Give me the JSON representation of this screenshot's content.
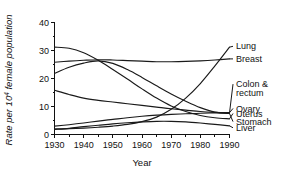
{
  "chart_data": {
    "type": "line",
    "title": "",
    "subtitle": "",
    "xlabel": "Year",
    "ylabel": "Rate per 10⁴ female population",
    "ylabel_prefix": "Rate per 10",
    "ylabel_exponent": "4",
    "ylabel_suffix": " female population",
    "xlim": [
      1930,
      1990
    ],
    "ylim": [
      0,
      40
    ],
    "xticks": [
      1930,
      1940,
      1950,
      1960,
      1970,
      1980,
      1990
    ],
    "xticklabels": [
      "1930",
      "1940",
      "1950",
      "1960",
      "1970",
      "1980",
      "1990"
    ],
    "yticks": [
      0,
      10,
      20,
      30,
      40
    ],
    "yticklabels": [
      "0",
      "10",
      "20",
      "30",
      "40"
    ],
    "yminorticks": [
      5,
      15,
      25,
      35
    ],
    "grid": false,
    "legend_position": "right-outside-labels",
    "line_color": "#1a1a1a",
    "x": [
      1930,
      1935,
      1940,
      1945,
      1950,
      1955,
      1960,
      1965,
      1970,
      1975,
      1980,
      1985,
      1990
    ],
    "series": [
      {
        "name": "Lung",
        "label": "Lung",
        "label_y_value": 31.5,
        "values": [
          2.0,
          2.1,
          2.3,
          2.6,
          3.0,
          3.6,
          4.6,
          6.2,
          9.0,
          13.0,
          18.2,
          24.5,
          31.2
        ]
      },
      {
        "name": "Breast",
        "label": "Breast",
        "label_y_value": 27.0,
        "values": [
          25.8,
          26.2,
          26.5,
          26.7,
          26.6,
          26.4,
          26.2,
          26.0,
          26.0,
          26.1,
          26.3,
          26.6,
          27.0
        ]
      },
      {
        "name": "Colon & rectum",
        "label": "Colon &",
        "label_line2": "rectum",
        "label_y_value": 18.0,
        "values": [
          15.8,
          14.3,
          13.0,
          12.2,
          11.6,
          11.0,
          10.4,
          9.8,
          9.2,
          8.7,
          8.2,
          7.9,
          7.7
        ]
      },
      {
        "name": "Ovary",
        "label": "Ovary",
        "label_y_value": 9.3,
        "values": [
          3.0,
          3.5,
          4.1,
          4.8,
          5.4,
          6.0,
          6.5,
          6.9,
          7.2,
          7.4,
          7.6,
          7.7,
          7.8
        ]
      },
      {
        "name": "Uterus",
        "label": "Uterus",
        "label_y_value": 7.5,
        "values": [
          31.2,
          30.8,
          29.2,
          26.5,
          23.2,
          19.8,
          16.3,
          13.0,
          10.2,
          8.2,
          6.8,
          6.0,
          5.6
        ]
      },
      {
        "name": "Stomach",
        "label": "Stomach",
        "label_y_value": 4.6,
        "values": [
          21.8,
          24.0,
          25.5,
          26.3,
          25.4,
          23.2,
          20.4,
          17.4,
          14.5,
          11.9,
          9.6,
          8.0,
          7.5
        ]
      },
      {
        "name": "Liver",
        "label": "Liver",
        "label_y_value": 2.4,
        "values": [
          1.8,
          2.2,
          2.8,
          3.3,
          3.8,
          4.2,
          4.5,
          4.7,
          4.7,
          4.5,
          4.1,
          3.6,
          3.1
        ]
      }
    ]
  }
}
